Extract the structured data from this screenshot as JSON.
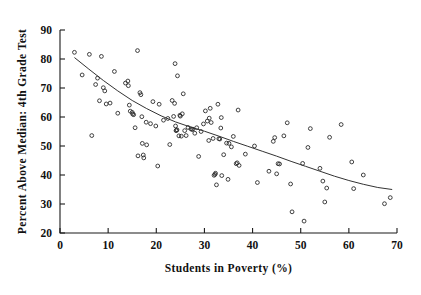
{
  "chart_data": {
    "type": "scatter",
    "title": "",
    "xlabel": "Students in Poverty (%)",
    "ylabel": "Percent Above Median: 4th Grade Test",
    "xlim": [
      0,
      70
    ],
    "ylim": [
      20,
      90
    ],
    "xticks": [
      0,
      10,
      20,
      30,
      40,
      50,
      60,
      70
    ],
    "yticks": [
      20,
      30,
      40,
      50,
      60,
      70,
      80,
      90
    ],
    "xtick_labels": [
      "0",
      "10",
      "20",
      "30",
      "40",
      "50",
      "60",
      "70"
    ],
    "ytick_labels": [
      "20",
      "30",
      "40",
      "50",
      "60",
      "70",
      "80",
      "90"
    ],
    "grid": false,
    "legend": null,
    "marker": "open-circle",
    "marker_color": "#2b2b2b",
    "fit_color": "#333333",
    "fit_label": "smoothed trend line",
    "points": [
      [
        3.0,
        82.3
      ],
      [
        4.6,
        74.5
      ],
      [
        6.1,
        81.6
      ],
      [
        6.6,
        53.6
      ],
      [
        7.4,
        71.2
      ],
      [
        7.8,
        73.4
      ],
      [
        8.2,
        65.6
      ],
      [
        8.6,
        80.9
      ],
      [
        9.0,
        70.1
      ],
      [
        9.3,
        69.0
      ],
      [
        9.6,
        64.5
      ],
      [
        10.4,
        64.8
      ],
      [
        11.3,
        75.7
      ],
      [
        12.0,
        61.3
      ],
      [
        13.6,
        71.7
      ],
      [
        14.1,
        72.4
      ],
      [
        14.2,
        70.8
      ],
      [
        14.4,
        64.1
      ],
      [
        14.6,
        62.0
      ],
      [
        15.0,
        61.6
      ],
      [
        15.1,
        61.0
      ],
      [
        15.3,
        60.8
      ],
      [
        15.6,
        56.3
      ],
      [
        16.1,
        82.9
      ],
      [
        16.2,
        46.6
      ],
      [
        16.6,
        68.4
      ],
      [
        16.8,
        67.7
      ],
      [
        17.0,
        60.1
      ],
      [
        17.1,
        50.9
      ],
      [
        17.3,
        46.9
      ],
      [
        17.4,
        45.9
      ],
      [
        17.9,
        58.2
      ],
      [
        18.0,
        50.4
      ],
      [
        18.8,
        57.7
      ],
      [
        19.3,
        65.3
      ],
      [
        19.9,
        56.9
      ],
      [
        20.3,
        43.1
      ],
      [
        20.6,
        64.4
      ],
      [
        21.5,
        58.9
      ],
      [
        22.4,
        59.5
      ],
      [
        22.8,
        50.5
      ],
      [
        23.3,
        65.7
      ],
      [
        23.6,
        60.2
      ],
      [
        23.8,
        64.7
      ],
      [
        23.9,
        78.4
      ],
      [
        24.0,
        56.9
      ],
      [
        24.1,
        55.3
      ],
      [
        24.2,
        55.4
      ],
      [
        24.3,
        55.6
      ],
      [
        24.4,
        74.2
      ],
      [
        24.7,
        53.5
      ],
      [
        24.9,
        60.6
      ],
      [
        25.0,
        60.3
      ],
      [
        25.2,
        53.4
      ],
      [
        25.4,
        61.1
      ],
      [
        25.6,
        68.0
      ],
      [
        25.9,
        55.3
      ],
      [
        26.2,
        53.6
      ],
      [
        26.6,
        56.4
      ],
      [
        27.2,
        55.9
      ],
      [
        27.4,
        55.7
      ],
      [
        27.6,
        55.8
      ],
      [
        28.0,
        54.4
      ],
      [
        28.4,
        56.3
      ],
      [
        28.8,
        46.4
      ],
      [
        29.3,
        55.0
      ],
      [
        29.8,
        57.6
      ],
      [
        30.2,
        62.1
      ],
      [
        30.6,
        58.6
      ],
      [
        30.9,
        51.9
      ],
      [
        31.0,
        59.6
      ],
      [
        31.2,
        63.0
      ],
      [
        31.4,
        58.1
      ],
      [
        31.8,
        52.6
      ],
      [
        32.0,
        39.9
      ],
      [
        32.2,
        40.2
      ],
      [
        32.3,
        40.6
      ],
      [
        32.5,
        36.6
      ],
      [
        32.8,
        64.4
      ],
      [
        33.0,
        52.5
      ],
      [
        33.2,
        52.4
      ],
      [
        33.4,
        56.2
      ],
      [
        33.5,
        59.8
      ],
      [
        33.6,
        39.8
      ],
      [
        34.0,
        47.0
      ],
      [
        34.6,
        51.0
      ],
      [
        34.9,
        38.5
      ],
      [
        35.1,
        50.9
      ],
      [
        35.6,
        49.7
      ],
      [
        36.0,
        53.3
      ],
      [
        36.6,
        43.9
      ],
      [
        36.8,
        44.2
      ],
      [
        37.0,
        62.4
      ],
      [
        37.2,
        43.3
      ],
      [
        38.5,
        47.2
      ],
      [
        40.4,
        50.0
      ],
      [
        41.0,
        37.4
      ],
      [
        43.4,
        41.3
      ],
      [
        44.3,
        51.6
      ],
      [
        44.6,
        52.9
      ],
      [
        45.0,
        40.4
      ],
      [
        45.3,
        43.9
      ],
      [
        45.6,
        43.8
      ],
      [
        46.5,
        53.5
      ],
      [
        47.2,
        58.0
      ],
      [
        47.9,
        36.9
      ],
      [
        48.2,
        27.3
      ],
      [
        50.4,
        44.0
      ],
      [
        50.7,
        24.1
      ],
      [
        51.5,
        49.5
      ],
      [
        52.0,
        56.0
      ],
      [
        54.0,
        42.3
      ],
      [
        54.6,
        37.9
      ],
      [
        55.0,
        30.7
      ],
      [
        55.4,
        35.5
      ],
      [
        56.0,
        53.0
      ],
      [
        58.4,
        57.4
      ],
      [
        60.6,
        44.5
      ],
      [
        61.0,
        35.3
      ],
      [
        63.0,
        40.0
      ],
      [
        67.4,
        30.1
      ],
      [
        68.6,
        32.2
      ]
    ],
    "fit_curve": [
      [
        3.0,
        80.5
      ],
      [
        6.0,
        76.5
      ],
      [
        9.0,
        72.6
      ],
      [
        12.0,
        69.0
      ],
      [
        15.0,
        65.7
      ],
      [
        18.0,
        62.9
      ],
      [
        21.0,
        60.4
      ],
      [
        24.0,
        58.3
      ],
      [
        27.0,
        56.6
      ],
      [
        30.0,
        55.1
      ],
      [
        33.0,
        53.4
      ],
      [
        36.0,
        51.6
      ],
      [
        39.0,
        49.9
      ],
      [
        42.0,
        48.2
      ],
      [
        45.0,
        46.5
      ],
      [
        48.0,
        44.7
      ],
      [
        51.0,
        43.0
      ],
      [
        54.0,
        41.3
      ],
      [
        57.0,
        39.6
      ],
      [
        60.0,
        38.1
      ],
      [
        63.0,
        36.8
      ],
      [
        66.0,
        35.7
      ],
      [
        69.0,
        35.0
      ]
    ]
  }
}
